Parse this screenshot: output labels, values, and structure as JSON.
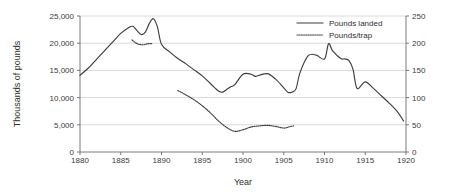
{
  "chart_data": {
    "type": "line",
    "title": "",
    "xlabel": "Year",
    "ylabel": "Thousands of pounds",
    "ylabel_right": "",
    "xlim": [
      1880,
      1920
    ],
    "ylim": [
      0,
      25000
    ],
    "ylim_right": [
      0,
      250
    ],
    "grid": true,
    "legend_position": "top-right",
    "x_ticks": [
      "1880",
      "1885",
      "1890",
      "1895",
      "1900",
      "1905",
      "1910",
      "1915",
      "1920"
    ],
    "x_tick_values": [
      1880,
      1885,
      1890,
      1895,
      1900,
      1905,
      1910,
      1915,
      1920
    ],
    "y_ticks": [
      "0",
      "5,000",
      "10,000",
      "15,000",
      "20,000",
      "25,000"
    ],
    "y_tick_values": [
      0,
      5000,
      10000,
      15000,
      20000,
      25000
    ],
    "y_ticks_right": [
      "0",
      "50",
      "100",
      "150",
      "200",
      "250"
    ],
    "y_tick_values_right": [
      0,
      50,
      100,
      150,
      200,
      250
    ],
    "series": [
      {
        "name": "Pounds landed",
        "style": "solid",
        "color": "#3d3d3d",
        "axis": "left",
        "x": [
          1880,
          1881,
          1882,
          1883,
          1884,
          1885,
          1886,
          1886.5,
          1887,
          1887.5,
          1888,
          1888.5,
          1889,
          1889.5,
          1890,
          1891,
          1892,
          1893,
          1894,
          1895,
          1896,
          1897,
          1897.5,
          1898,
          1898.5,
          1899,
          1900,
          1901,
          1901.5,
          1902,
          1903,
          1904,
          1905,
          1905.5,
          1906,
          1906.5,
          1907,
          1908,
          1909,
          1910,
          1910.5,
          1911,
          1912,
          1912.5,
          1913,
          1913.5,
          1914,
          1915,
          1916,
          1917,
          1918,
          1919,
          1919.7
        ],
        "values": [
          14100,
          15400,
          17000,
          18600,
          20200,
          21800,
          22900,
          23100,
          22300,
          21600,
          22000,
          23600,
          24500,
          23000,
          19800,
          18400,
          17200,
          16200,
          15100,
          14000,
          12600,
          11200,
          11000,
          11500,
          12000,
          12400,
          14300,
          14300,
          13900,
          14100,
          14400,
          13400,
          11800,
          11000,
          11000,
          11600,
          14600,
          17700,
          17800,
          17100,
          19900,
          18600,
          17200,
          17100,
          16800,
          15200,
          11700,
          12900,
          11700,
          10300,
          8900,
          7300,
          5700
        ]
      },
      {
        "name": "Pounds/trap",
        "style": "dotted",
        "color": "#3d3d3d",
        "axis": "right",
        "segments": [
          {
            "x": [
              1886.4,
              1886.8,
              1887.2,
              1887.8,
              1888.3,
              1888.9
            ],
            "values": [
              206,
              201,
              198,
              197,
              199,
              199
            ]
          },
          {
            "x": [
              1892,
              1893,
              1894,
              1895,
              1896,
              1897,
              1898,
              1899,
              1900,
              1901,
              1902,
              1903,
              1904,
              1905,
              1905.6,
              1906.2
            ],
            "values": [
              113,
              105,
              96,
              85,
              72,
              57,
              45,
              38,
              41,
              46,
              48,
              49,
              47,
              44,
              46,
              48
            ]
          }
        ]
      }
    ]
  },
  "legend": {
    "items": [
      {
        "label": "Pounds landed",
        "style": "solid"
      },
      {
        "label": "Pounds/trap",
        "style": "dotted"
      }
    ]
  }
}
